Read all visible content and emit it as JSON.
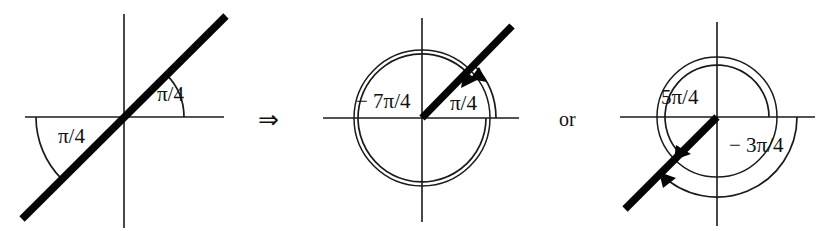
{
  "figure": {
    "connector_symbol": "⇒",
    "conjunction_label": "or",
    "background_color": "#ffffff",
    "ink_color": "#111111",
    "panels": [
      {
        "id": "panel-line-through-origin",
        "name": "line-with-two-pi-over-4-angles",
        "origin": {
          "x": 124,
          "y": 117
        },
        "has_circle": false,
        "x_axis": {
          "x1": 25,
          "x2": 224,
          "y": 117
        },
        "y_axis": {
          "y1": 14,
          "y2": 228,
          "x": 124
        },
        "ray": {
          "name": "thick-diagonal-line",
          "x1": 22,
          "y1": 219,
          "x2": 226,
          "y2": 16,
          "angle_deg": 45,
          "extends_both_directions": true
        },
        "labels": [
          {
            "name": "angle-label-upper-right",
            "text": "π/4",
            "x": 157,
            "y": 101,
            "arc": {
              "radius": 60,
              "start_deg": 0,
              "end_deg": 45,
              "arrow": false
            }
          },
          {
            "name": "angle-label-lower-left",
            "text": "π/4",
            "x": 58,
            "y": 143,
            "arc": {
              "radius": 88,
              "start_deg": 180,
              "end_deg": 225,
              "arrow": false
            }
          }
        ]
      },
      {
        "id": "panel-positive-and-negative-first",
        "name": "unit-circle-pi-over-4-and-neg-7pi-over-4",
        "origin": {
          "x": 422,
          "y": 118
        },
        "has_circle": true,
        "circle_radius": 68,
        "x_axis": {
          "x1": 323,
          "x2": 519,
          "y": 118
        },
        "y_axis": {
          "y1": 18,
          "y2": 222,
          "x": 422
        },
        "ray": {
          "name": "thick-ray-first-quadrant",
          "x1": 422,
          "y1": 118,
          "x2": 512,
          "y2": 26,
          "angle_deg": 45,
          "extends_both_directions": false
        },
        "labels": [
          {
            "name": "angle-label-negative-seven-pi-over-4",
            "text": "− 7π/4",
            "x": 356,
            "y": 108,
            "arc": {
              "radius": 64,
              "start_deg": 45,
              "end_deg": 360,
              "sweep": "clockwise",
              "arrow": true,
              "arrow_at_deg": 55
            }
          },
          {
            "name": "angle-label-pi-over-4",
            "text": "π/4",
            "x": 450,
            "y": 110,
            "arc": {
              "radius": 74,
              "start_deg": 0,
              "end_deg": 45,
              "sweep": "counterclockwise",
              "arrow": true,
              "arrow_at_deg": 42
            }
          }
        ]
      },
      {
        "id": "panel-positive-and-negative-second",
        "name": "unit-circle-5pi-over-4-and-neg-3pi-over-4",
        "origin": {
          "x": 717,
          "y": 117
        },
        "has_circle": true,
        "circle_radius": 60,
        "x_axis": {
          "x1": 620,
          "x2": 815,
          "y": 117
        },
        "y_axis": {
          "y1": 22,
          "y2": 226,
          "x": 717
        },
        "ray": {
          "name": "thick-ray-third-quadrant",
          "x1": 717,
          "y1": 117,
          "x2": 625,
          "y2": 209,
          "angle_deg": 225,
          "extends_both_directions": false
        },
        "labels": [
          {
            "name": "angle-label-five-pi-over-4",
            "text": "5π/4",
            "x": 661,
            "y": 104,
            "arc": {
              "radius": 52,
              "start_deg": 0,
              "end_deg": 225,
              "sweep": "counterclockwise",
              "arrow": true,
              "arrow_at_deg": 218
            }
          },
          {
            "name": "angle-label-negative-three-pi-over-4",
            "text": "− 3π/4",
            "x": 729,
            "y": 152,
            "arc": {
              "radius": 80,
              "start_deg": 0,
              "end_deg": -135,
              "sweep": "clockwise",
              "arrow": true,
              "arrow_at_deg": -128
            }
          }
        ]
      }
    ],
    "connector": {
      "x": 271,
      "y": 120
    },
    "conjunction": {
      "x": 570,
      "y": 120
    }
  }
}
